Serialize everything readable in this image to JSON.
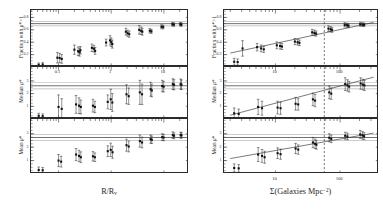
{
  "figure": {
    "kind": "scientific-figure",
    "columns": 2,
    "rows": 3
  },
  "axis_labels": {
    "y_top": "Fraction with μ*>1",
    "y_mid": "Median μ*",
    "y_bot": "Mean μ*",
    "x_left": "R/R",
    "x_left_sub": "v",
    "x_right_prefix": "Σ(Galaxies Mpc",
    "x_right_exp": "−2",
    "x_right_suffix": ")"
  },
  "colors": {
    "axis": "#2b2b2b",
    "point": "#111111",
    "errorbar": "#222222",
    "reference_line": "#3a3a3a",
    "fit_line": "#333333",
    "dashed_line": "#2e2e2e",
    "background": "#ffffff"
  },
  "chart_data": [
    {
      "id": "left-top",
      "type": "scatter",
      "title": "",
      "xlabel": "R/Rv",
      "ylabel": "Fraction with mu*>1",
      "xscale": "log",
      "yscale": "linear",
      "xlim": [
        0.03,
        30
      ],
      "ylim": [
        0.0,
        0.92
      ],
      "xticks": [
        0.1,
        1,
        10
      ],
      "xticklabels": [
        "0.1",
        "1",
        "10"
      ],
      "yticks": [
        0.2,
        0.4,
        0.6,
        0.8
      ],
      "yticklabels": [
        "0.2",
        "0.4",
        "0.6",
        "0.8"
      ],
      "grid": false,
      "reference_lines": [
        {
          "y": 0.7,
          "style": "solid"
        },
        {
          "y": 0.665,
          "style": "solid"
        },
        {
          "y": 0.735,
          "style": "solid"
        }
      ],
      "points": [
        {
          "x": 0.042,
          "y": 0.035,
          "yerr": 0.03
        },
        {
          "x": 0.05,
          "y": 0.04,
          "yerr": 0.03
        },
        {
          "x": 0.095,
          "y": 0.15,
          "yerr": 0.085
        },
        {
          "x": 0.105,
          "y": 0.145,
          "yerr": 0.075
        },
        {
          "x": 0.115,
          "y": 0.13,
          "yerr": 0.07
        },
        {
          "x": 0.2,
          "y": 0.28,
          "yerr": 0.075
        },
        {
          "x": 0.235,
          "y": 0.255,
          "yerr": 0.07
        },
        {
          "x": 0.25,
          "y": 0.24,
          "yerr": 0.065
        },
        {
          "x": 0.26,
          "y": 0.27,
          "yerr": 0.06
        },
        {
          "x": 0.43,
          "y": 0.31,
          "yerr": 0.06
        },
        {
          "x": 0.47,
          "y": 0.295,
          "yerr": 0.055
        },
        {
          "x": 0.495,
          "y": 0.26,
          "yerr": 0.055
        },
        {
          "x": 0.8,
          "y": 0.395,
          "yerr": 0.055
        },
        {
          "x": 0.95,
          "y": 0.43,
          "yerr": 0.075
        },
        {
          "x": 1.0,
          "y": 0.4,
          "yerr": 0.07
        },
        {
          "x": 1.05,
          "y": 0.37,
          "yerr": 0.065
        },
        {
          "x": 1.9,
          "y": 0.57,
          "yerr": 0.055
        },
        {
          "x": 2.05,
          "y": 0.545,
          "yerr": 0.05
        },
        {
          "x": 2.2,
          "y": 0.53,
          "yerr": 0.05
        },
        {
          "x": 3.4,
          "y": 0.6,
          "yerr": 0.07
        },
        {
          "x": 3.7,
          "y": 0.585,
          "yerr": 0.06
        },
        {
          "x": 3.9,
          "y": 0.57,
          "yerr": 0.055
        },
        {
          "x": 5.4,
          "y": 0.585,
          "yerr": 0.035
        },
        {
          "x": 5.8,
          "y": 0.575,
          "yerr": 0.032
        },
        {
          "x": 9.0,
          "y": 0.65,
          "yerr": 0.032
        },
        {
          "x": 9.7,
          "y": 0.645,
          "yerr": 0.03
        },
        {
          "x": 14.5,
          "y": 0.69,
          "yerr": 0.03
        },
        {
          "x": 15.5,
          "y": 0.685,
          "yerr": 0.028
        },
        {
          "x": 20.5,
          "y": 0.69,
          "yerr": 0.028
        },
        {
          "x": 21.5,
          "y": 0.685,
          "yerr": 0.026
        }
      ]
    },
    {
      "id": "left-mid",
      "type": "scatter",
      "xlabel": "R/Rv",
      "ylabel": "Median mu*",
      "xscale": "log",
      "yscale": "linear",
      "xlim": [
        0.03,
        30
      ],
      "ylim": [
        0.0,
        4.1
      ],
      "yticks": [
        1,
        2,
        3
      ],
      "yticklabels": [
        "1",
        "2",
        "3"
      ],
      "reference_lines": [
        {
          "y": 2.62,
          "style": "solid"
        },
        {
          "y": 2.38,
          "style": "solid"
        },
        {
          "y": 2.86,
          "style": "solid"
        }
      ],
      "points": [
        {
          "x": 0.042,
          "y": 0.25,
          "yerr": 0.2
        },
        {
          "x": 0.05,
          "y": 0.22,
          "yerr": 0.18
        },
        {
          "x": 0.1,
          "y": 0.95,
          "yerr": 0.95
        },
        {
          "x": 0.115,
          "y": 0.8,
          "yerr": 0.8
        },
        {
          "x": 0.215,
          "y": 1.15,
          "yerr": 0.7
        },
        {
          "x": 0.245,
          "y": 1.05,
          "yerr": 0.62
        },
        {
          "x": 0.265,
          "y": 0.95,
          "yerr": 0.55
        },
        {
          "x": 0.45,
          "y": 1.05,
          "yerr": 0.5
        },
        {
          "x": 0.49,
          "y": 0.95,
          "yerr": 0.45
        },
        {
          "x": 0.86,
          "y": 1.35,
          "yerr": 0.55
        },
        {
          "x": 0.98,
          "y": 1.55,
          "yerr": 0.8
        },
        {
          "x": 1.05,
          "y": 1.3,
          "yerr": 0.7
        },
        {
          "x": 1.95,
          "y": 1.95,
          "yerr": 0.75
        },
        {
          "x": 2.15,
          "y": 1.8,
          "yerr": 0.65
        },
        {
          "x": 3.5,
          "y": 2.1,
          "yerr": 0.95
        },
        {
          "x": 3.85,
          "y": 1.95,
          "yerr": 0.8
        },
        {
          "x": 5.6,
          "y": 2.35,
          "yerr": 0.55
        },
        {
          "x": 5.9,
          "y": 2.25,
          "yerr": 0.5
        },
        {
          "x": 9.3,
          "y": 2.6,
          "yerr": 0.45
        },
        {
          "x": 9.9,
          "y": 2.55,
          "yerr": 0.42
        },
        {
          "x": 14.8,
          "y": 2.75,
          "yerr": 0.42
        },
        {
          "x": 15.6,
          "y": 2.7,
          "yerr": 0.4
        },
        {
          "x": 20.8,
          "y": 2.75,
          "yerr": 0.4
        },
        {
          "x": 21.6,
          "y": 2.7,
          "yerr": 0.38
        }
      ]
    },
    {
      "id": "left-bot",
      "type": "scatter",
      "xlabel": "R/Rv",
      "ylabel": "Mean mu*",
      "xscale": "log",
      "yscale": "linear",
      "xlim": [
        0.03,
        30
      ],
      "ylim": [
        0.0,
        4.1
      ],
      "yticks": [
        1,
        2,
        3
      ],
      "yticklabels": [
        "1",
        "2",
        "3"
      ],
      "reference_lines": [
        {
          "y": 2.72,
          "style": "solid"
        },
        {
          "y": 2.5,
          "style": "solid"
        },
        {
          "y": 2.94,
          "style": "solid"
        }
      ],
      "points": [
        {
          "x": 0.042,
          "y": 0.3,
          "yerr": 0.22
        },
        {
          "x": 0.05,
          "y": 0.28,
          "yerr": 0.2
        },
        {
          "x": 0.1,
          "y": 1.0,
          "yerr": 0.45
        },
        {
          "x": 0.112,
          "y": 0.92,
          "yerr": 0.4
        },
        {
          "x": 0.215,
          "y": 1.45,
          "yerr": 0.45
        },
        {
          "x": 0.245,
          "y": 1.35,
          "yerr": 0.42
        },
        {
          "x": 0.265,
          "y": 1.25,
          "yerr": 0.4
        },
        {
          "x": 0.45,
          "y": 1.32,
          "yerr": 0.35
        },
        {
          "x": 0.49,
          "y": 1.25,
          "yerr": 0.32
        },
        {
          "x": 0.86,
          "y": 1.7,
          "yerr": 0.4
        },
        {
          "x": 0.98,
          "y": 1.8,
          "yerr": 0.5
        },
        {
          "x": 1.06,
          "y": 1.62,
          "yerr": 0.45
        },
        {
          "x": 1.95,
          "y": 2.15,
          "yerr": 0.45
        },
        {
          "x": 2.15,
          "y": 2.05,
          "yerr": 0.4
        },
        {
          "x": 3.5,
          "y": 2.45,
          "yerr": 0.45
        },
        {
          "x": 3.85,
          "y": 2.35,
          "yerr": 0.4
        },
        {
          "x": 5.6,
          "y": 2.6,
          "yerr": 0.3
        },
        {
          "x": 5.9,
          "y": 2.55,
          "yerr": 0.28
        },
        {
          "x": 9.3,
          "y": 2.75,
          "yerr": 0.25
        },
        {
          "x": 9.9,
          "y": 2.72,
          "yerr": 0.24
        },
        {
          "x": 14.8,
          "y": 2.9,
          "yerr": 0.24
        },
        {
          "x": 15.6,
          "y": 2.85,
          "yerr": 0.22
        },
        {
          "x": 20.8,
          "y": 2.9,
          "yerr": 0.22
        },
        {
          "x": 21.6,
          "y": 2.88,
          "yerr": 0.2
        }
      ]
    },
    {
      "id": "right-top",
      "type": "scatter",
      "xlabel": "Sigma(Galaxies Mpc^-2)",
      "ylabel": "Fraction with mu*>1",
      "xscale": "log",
      "yscale": "linear",
      "xlim": [
        1.6,
        400
      ],
      "ylim": [
        0.0,
        0.92
      ],
      "xticks": [
        10,
        100
      ],
      "xticklabels": [
        "10",
        "100"
      ],
      "yticks": [
        0.2,
        0.4,
        0.6,
        0.8
      ],
      "yticklabels": [
        "0.2",
        "0.4",
        "0.6",
        "0.8"
      ],
      "reference_lines": [
        {
          "y": 0.7,
          "style": "solid"
        },
        {
          "y": 0.665,
          "style": "solid"
        },
        {
          "y": 0.735,
          "style": "solid"
        }
      ],
      "fit_line": {
        "x1": 2.0,
        "y1": 0.225,
        "x2": 330,
        "y2": 0.72
      },
      "vline": {
        "x": 57,
        "style": "dashed"
      },
      "points": [
        {
          "x": 2.3,
          "y": 0.085,
          "yerr": 0.055
        },
        {
          "x": 2.6,
          "y": 0.08,
          "yerr": 0.05
        },
        {
          "x": 3.1,
          "y": 0.3,
          "yerr": 0.125
        },
        {
          "x": 5.2,
          "y": 0.32,
          "yerr": 0.06
        },
        {
          "x": 6.0,
          "y": 0.3,
          "yerr": 0.055
        },
        {
          "x": 6.6,
          "y": 0.285,
          "yerr": 0.05
        },
        {
          "x": 10.5,
          "y": 0.35,
          "yerr": 0.055
        },
        {
          "x": 11.8,
          "y": 0.34,
          "yerr": 0.05
        },
        {
          "x": 12.6,
          "y": 0.33,
          "yerr": 0.048
        },
        {
          "x": 20.0,
          "y": 0.41,
          "yerr": 0.05
        },
        {
          "x": 22.0,
          "y": 0.4,
          "yerr": 0.045
        },
        {
          "x": 23.5,
          "y": 0.39,
          "yerr": 0.045
        },
        {
          "x": 37.0,
          "y": 0.56,
          "yerr": 0.048
        },
        {
          "x": 40.0,
          "y": 0.55,
          "yerr": 0.045
        },
        {
          "x": 42.5,
          "y": 0.54,
          "yerr": 0.042
        },
        {
          "x": 66.0,
          "y": 0.62,
          "yerr": 0.045
        },
        {
          "x": 71.0,
          "y": 0.61,
          "yerr": 0.042
        },
        {
          "x": 75.0,
          "y": 0.6,
          "yerr": 0.04
        },
        {
          "x": 118.0,
          "y": 0.68,
          "yerr": 0.035
        },
        {
          "x": 128.0,
          "y": 0.675,
          "yerr": 0.032
        },
        {
          "x": 135.0,
          "y": 0.665,
          "yerr": 0.03
        },
        {
          "x": 205.0,
          "y": 0.69,
          "yerr": 0.032
        },
        {
          "x": 222.0,
          "y": 0.685,
          "yerr": 0.03
        },
        {
          "x": 235.0,
          "y": 0.68,
          "yerr": 0.028
        }
      ]
    },
    {
      "id": "right-mid",
      "type": "scatter",
      "xlabel": "Sigma(Galaxies Mpc^-2)",
      "ylabel": "Median mu*",
      "xscale": "log",
      "yscale": "linear",
      "xlim": [
        1.6,
        400
      ],
      "ylim": [
        0.0,
        4.1
      ],
      "yticks": [
        1,
        2,
        3
      ],
      "yticklabels": [
        "1",
        "2",
        "3"
      ],
      "reference_lines": [
        {
          "y": 2.62,
          "style": "solid"
        },
        {
          "y": 2.38,
          "style": "solid"
        },
        {
          "y": 2.86,
          "style": "solid"
        }
      ],
      "fit_line": {
        "x1": 2.0,
        "y1": 0.3,
        "x2": 330,
        "y2": 3.3
      },
      "vline": {
        "x": 57,
        "style": "dashed"
      },
      "points": [
        {
          "x": 2.3,
          "y": 0.45,
          "yerr": 0.42
        },
        {
          "x": 2.7,
          "y": 0.4,
          "yerr": 0.38
        },
        {
          "x": 5.4,
          "y": 0.95,
          "yerr": 0.6
        },
        {
          "x": 6.2,
          "y": 0.85,
          "yerr": 0.55
        },
        {
          "x": 10.8,
          "y": 0.9,
          "yerr": 0.5
        },
        {
          "x": 12.0,
          "y": 0.85,
          "yerr": 0.48
        },
        {
          "x": 20.5,
          "y": 1.2,
          "yerr": 0.5
        },
        {
          "x": 22.5,
          "y": 1.15,
          "yerr": 0.45
        },
        {
          "x": 38.0,
          "y": 1.55,
          "yerr": 0.5
        },
        {
          "x": 41.0,
          "y": 1.45,
          "yerr": 0.48
        },
        {
          "x": 68.0,
          "y": 2.1,
          "yerr": 0.5
        },
        {
          "x": 73.0,
          "y": 2.0,
          "yerr": 0.45
        },
        {
          "x": 120.0,
          "y": 2.75,
          "yerr": 0.5
        },
        {
          "x": 130.0,
          "y": 2.65,
          "yerr": 0.45
        },
        {
          "x": 138.0,
          "y": 2.55,
          "yerr": 0.42
        },
        {
          "x": 208.0,
          "y": 2.8,
          "yerr": 0.45
        },
        {
          "x": 225.0,
          "y": 2.72,
          "yerr": 0.42
        },
        {
          "x": 238.0,
          "y": 2.65,
          "yerr": 0.4
        }
      ]
    },
    {
      "id": "right-bot",
      "type": "scatter",
      "xlabel": "Sigma(Galaxies Mpc^-2)",
      "ylabel": "Mean mu*",
      "xscale": "log",
      "yscale": "linear",
      "xlim": [
        1.6,
        400
      ],
      "ylim": [
        0.0,
        4.1
      ],
      "xticks": [
        10,
        100
      ],
      "xticklabels": [
        "10",
        "100"
      ],
      "yticks": [
        1,
        2,
        3
      ],
      "yticklabels": [
        "1",
        "2",
        "3"
      ],
      "reference_lines": [
        {
          "y": 2.72,
          "style": "solid"
        },
        {
          "y": 2.5,
          "style": "solid"
        },
        {
          "y": 2.94,
          "style": "solid"
        }
      ],
      "fit_line": {
        "x1": 2.0,
        "y1": 1.15,
        "x2": 330,
        "y2": 3.05
      },
      "vline": {
        "x": 57,
        "style": "dashed"
      },
      "points": [
        {
          "x": 2.3,
          "y": 0.45,
          "yerr": 0.3
        },
        {
          "x": 2.7,
          "y": 0.42,
          "yerr": 0.28
        },
        {
          "x": 5.4,
          "y": 1.45,
          "yerr": 0.52
        },
        {
          "x": 6.2,
          "y": 1.35,
          "yerr": 0.48
        },
        {
          "x": 6.8,
          "y": 1.25,
          "yerr": 0.45
        },
        {
          "x": 10.8,
          "y": 1.55,
          "yerr": 0.4
        },
        {
          "x": 12.0,
          "y": 1.48,
          "yerr": 0.38
        },
        {
          "x": 20.5,
          "y": 1.9,
          "yerr": 0.38
        },
        {
          "x": 22.5,
          "y": 1.82,
          "yerr": 0.35
        },
        {
          "x": 38.0,
          "y": 2.35,
          "yerr": 0.38
        },
        {
          "x": 41.0,
          "y": 2.25,
          "yerr": 0.35
        },
        {
          "x": 43.0,
          "y": 2.18,
          "yerr": 0.33
        },
        {
          "x": 68.0,
          "y": 2.7,
          "yerr": 0.3
        },
        {
          "x": 73.0,
          "y": 2.62,
          "yerr": 0.28
        },
        {
          "x": 120.0,
          "y": 2.85,
          "yerr": 0.26
        },
        {
          "x": 130.0,
          "y": 2.8,
          "yerr": 0.25
        },
        {
          "x": 205.0,
          "y": 2.95,
          "yerr": 0.3
        },
        {
          "x": 222.0,
          "y": 2.88,
          "yerr": 0.28
        },
        {
          "x": 235.0,
          "y": 2.82,
          "yerr": 0.26
        }
      ]
    }
  ]
}
